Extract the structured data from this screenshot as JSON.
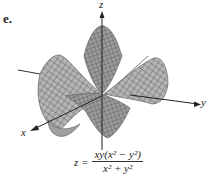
{
  "figure": {
    "label": "e.",
    "axes": {
      "x": "x",
      "y": "y",
      "z": "z"
    },
    "formula": {
      "lhs": "z =",
      "numerator": "xy(x² − y²)",
      "denominator": "x² + y²"
    },
    "colors": {
      "surface_fill": "#a9a9a9",
      "mesh": "#444444",
      "axis": "#222222"
    }
  }
}
